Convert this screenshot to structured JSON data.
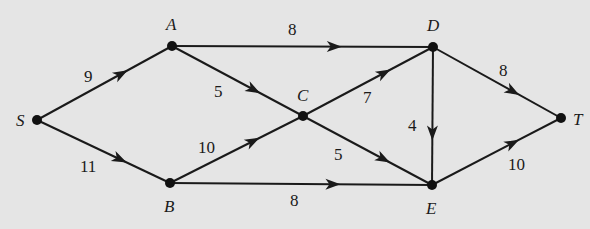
{
  "diagram": {
    "type": "directed-network-flow-graph",
    "background": "#e5e5e5",
    "stroke_color": "#1a1a1a",
    "nodes": [
      {
        "id": "S",
        "label": "S",
        "x": 37,
        "y": 120,
        "lx": 16,
        "ly": 126
      },
      {
        "id": "A",
        "label": "A",
        "x": 172,
        "y": 46,
        "lx": 166,
        "ly": 30
      },
      {
        "id": "B",
        "label": "B",
        "x": 170,
        "y": 183,
        "lx": 164,
        "ly": 212
      },
      {
        "id": "C",
        "label": "C",
        "x": 303,
        "y": 116,
        "lx": 297,
        "ly": 101
      },
      {
        "id": "D",
        "label": "D",
        "x": 433,
        "y": 47,
        "lx": 427,
        "ly": 31
      },
      {
        "id": "E",
        "label": "E",
        "x": 432,
        "y": 185,
        "lx": 426,
        "ly": 214
      },
      {
        "id": "T",
        "label": "T",
        "x": 561,
        "y": 118,
        "lx": 573,
        "ly": 125
      }
    ],
    "edges": [
      {
        "from": "S",
        "to": "A",
        "capacity": "9",
        "lx": 84,
        "ly": 82
      },
      {
        "from": "S",
        "to": "B",
        "capacity": "11",
        "lx": 80,
        "ly": 172
      },
      {
        "from": "A",
        "to": "D",
        "capacity": "8",
        "lx": 288,
        "ly": 35
      },
      {
        "from": "A",
        "to": "C",
        "capacity": "5",
        "lx": 214,
        "ly": 97
      },
      {
        "from": "B",
        "to": "C",
        "capacity": "10",
        "lx": 198,
        "ly": 153
      },
      {
        "from": "B",
        "to": "E",
        "capacity": "8",
        "lx": 290,
        "ly": 206
      },
      {
        "from": "C",
        "to": "D",
        "capacity": "7",
        "lx": 363,
        "ly": 103
      },
      {
        "from": "C",
        "to": "E",
        "capacity": "5",
        "lx": 334,
        "ly": 160
      },
      {
        "from": "D",
        "to": "E",
        "capacity": "4",
        "lx": 408,
        "ly": 131
      },
      {
        "from": "D",
        "to": "T",
        "capacity": "8",
        "lx": 499,
        "ly": 76
      },
      {
        "from": "E",
        "to": "T",
        "capacity": "10",
        "lx": 508,
        "ly": 170
      }
    ]
  }
}
